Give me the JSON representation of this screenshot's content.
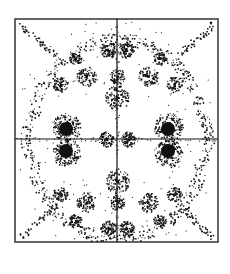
{
  "figure": {
    "colors": {
      "ink": "#111111",
      "frame": "#333333",
      "background": "#ffffff"
    },
    "frame": {
      "x": 15,
      "y": 19,
      "width": 203,
      "height": 223
    },
    "axes": {
      "cx": 117,
      "cy": 139
    },
    "solid_disks": [
      {
        "cx": 66,
        "cy": 129,
        "r": 7
      },
      {
        "cx": 66,
        "cy": 151,
        "r": 7
      },
      {
        "cx": 168,
        "cy": 129,
        "r": 7
      },
      {
        "cx": 168,
        "cy": 151,
        "r": 7
      }
    ],
    "ring_clusters": [
      {
        "cx": 66,
        "cy": 127,
        "r": 13,
        "density": 70
      },
      {
        "cx": 66,
        "cy": 153,
        "r": 13,
        "density": 70
      },
      {
        "cx": 168,
        "cy": 127,
        "r": 13,
        "density": 70
      },
      {
        "cx": 168,
        "cy": 153,
        "r": 13,
        "density": 70
      },
      {
        "cx": 108,
        "cy": 50,
        "r": 7,
        "density": 40
      },
      {
        "cx": 126,
        "cy": 50,
        "r": 7,
        "density": 40
      },
      {
        "cx": 108,
        "cy": 228,
        "r": 7,
        "density": 40
      },
      {
        "cx": 126,
        "cy": 228,
        "r": 7,
        "density": 40
      },
      {
        "cx": 117,
        "cy": 97,
        "r": 11,
        "density": 50
      },
      {
        "cx": 117,
        "cy": 181,
        "r": 11,
        "density": 50
      },
      {
        "cx": 117,
        "cy": 76,
        "r": 7,
        "density": 30
      },
      {
        "cx": 117,
        "cy": 202,
        "r": 7,
        "density": 30
      },
      {
        "cx": 86,
        "cy": 76,
        "r": 9,
        "density": 40
      },
      {
        "cx": 148,
        "cy": 76,
        "r": 9,
        "density": 40
      },
      {
        "cx": 86,
        "cy": 202,
        "r": 9,
        "density": 40
      },
      {
        "cx": 148,
        "cy": 202,
        "r": 9,
        "density": 40
      },
      {
        "cx": 106,
        "cy": 139,
        "r": 7,
        "density": 35
      },
      {
        "cx": 128,
        "cy": 139,
        "r": 7,
        "density": 35
      },
      {
        "cx": 60,
        "cy": 84,
        "r": 7,
        "density": 30
      },
      {
        "cx": 174,
        "cy": 84,
        "r": 7,
        "density": 30
      },
      {
        "cx": 60,
        "cy": 194,
        "r": 7,
        "density": 30
      },
      {
        "cx": 174,
        "cy": 194,
        "r": 7,
        "density": 30
      },
      {
        "cx": 75,
        "cy": 58,
        "r": 6,
        "density": 25
      },
      {
        "cx": 159,
        "cy": 58,
        "r": 6,
        "density": 25
      },
      {
        "cx": 75,
        "cy": 220,
        "r": 6,
        "density": 25
      },
      {
        "cx": 159,
        "cy": 220,
        "r": 6,
        "density": 25
      }
    ],
    "arc_bands": [
      {
        "cx": 117,
        "cy": 139,
        "rx": 88,
        "ry": 100,
        "start": 200,
        "end": 340,
        "width": 6,
        "density": 260
      },
      {
        "cx": 117,
        "cy": 139,
        "rx": 88,
        "ry": 100,
        "start": 20,
        "end": 160,
        "width": 6,
        "density": 260
      },
      {
        "cx": 117,
        "cy": 139,
        "rx": 92,
        "ry": 60,
        "start": 150,
        "end": 210,
        "width": 5,
        "density": 80
      },
      {
        "cx": 117,
        "cy": 139,
        "rx": 92,
        "ry": 60,
        "start": -30,
        "end": 30,
        "width": 5,
        "density": 80
      }
    ],
    "corner_streaks": [
      {
        "x1": 20,
        "y1": 24,
        "x2": 55,
        "y2": 55,
        "density": 45
      },
      {
        "x1": 213,
        "y1": 24,
        "x2": 178,
        "y2": 55,
        "density": 45
      },
      {
        "x1": 20,
        "y1": 238,
        "x2": 55,
        "y2": 205,
        "density": 45
      },
      {
        "x1": 213,
        "y1": 238,
        "x2": 178,
        "y2": 205,
        "density": 45
      }
    ],
    "scatter_dots": 220,
    "seed": 7
  }
}
